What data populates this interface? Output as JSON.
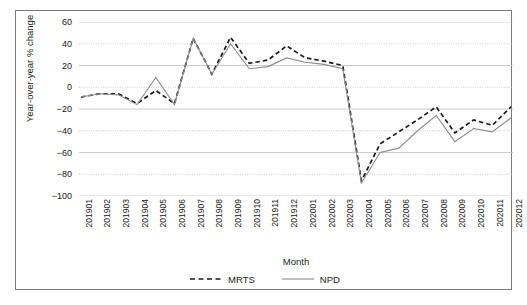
{
  "chart_data": {
    "type": "line",
    "title": "",
    "xlabel": "Month",
    "ylabel": "Year-over-year % change",
    "ylim": [
      -100,
      60
    ],
    "ytick_step": 20,
    "yticks": [
      60,
      40,
      20,
      0,
      -20,
      -40,
      -60,
      -80,
      -100
    ],
    "ytick_labels": [
      "60",
      "40",
      "20",
      "0",
      "−20",
      "−40",
      "−60",
      "−80",
      "−100"
    ],
    "grid": true,
    "legend_position": "bottom-center",
    "categories": [
      "201901",
      "201902",
      "201903",
      "201904",
      "201905",
      "201906",
      "201907",
      "201908",
      "201909",
      "201910",
      "201911",
      "201912",
      "202001",
      "202002",
      "202003",
      "202004",
      "202005",
      "202006",
      "202007",
      "202008",
      "202009",
      "202010",
      "202011",
      "202012"
    ],
    "series": [
      {
        "name": "MRTS",
        "style": "dashed",
        "color": "#1a1a1a",
        "values": [
          -9,
          -6,
          -6,
          -15,
          -3,
          -15,
          45,
          12,
          46,
          22,
          25,
          38,
          27,
          24,
          20,
          -86,
          -52,
          -41,
          -30,
          -18,
          -42,
          -30,
          -35,
          -18
        ]
      },
      {
        "name": "NPD",
        "style": "solid",
        "color": "#8c8c8c",
        "values": [
          -9,
          -6,
          -7,
          -16,
          9,
          -16,
          45,
          12,
          40,
          17,
          19,
          27,
          23,
          21,
          17,
          -88,
          -60,
          -56,
          -40,
          -26,
          -50,
          -38,
          -41,
          -28
        ]
      }
    ]
  },
  "legend": {
    "items": [
      {
        "label": "MRTS",
        "style": "dashed",
        "color": "#1a1a1a"
      },
      {
        "label": "NPD",
        "style": "solid",
        "color": "#8c8c8c"
      }
    ]
  }
}
